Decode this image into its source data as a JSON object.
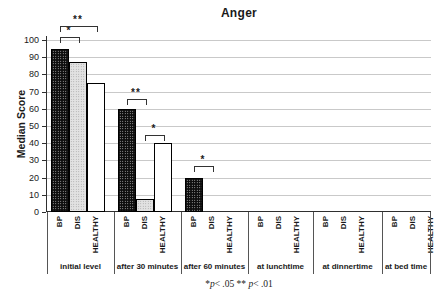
{
  "chart_data": {
    "type": "bar",
    "title": "Anger",
    "xlabel": "",
    "ylabel": "Median Score",
    "ylim": [
      0,
      100
    ],
    "yticks": [
      0,
      10,
      20,
      30,
      40,
      50,
      60,
      70,
      80,
      90,
      100
    ],
    "grid": "horizontal",
    "legend_position": "none",
    "categories": [
      "initial level",
      "after 30 minutes",
      "after 60 minutes",
      "at lunchtime",
      "at dinnertime",
      "at bed time"
    ],
    "series": [
      {
        "name": "BP",
        "fill": "black-dotted",
        "values": [
          95,
          60,
          20,
          0,
          0,
          0
        ]
      },
      {
        "name": "DIS",
        "fill": "gray-dotted",
        "values": [
          87.5,
          7.5,
          0,
          0,
          0,
          0
        ]
      },
      {
        "name": "HEALTHY",
        "fill": "white",
        "values": [
          75,
          40,
          0,
          0,
          0,
          0
        ]
      }
    ],
    "significance_brackets": [
      {
        "category": "initial level",
        "from": "BP",
        "to": "DIS",
        "label": "*",
        "y_value": 102
      },
      {
        "category": "initial level",
        "from": "BP",
        "to": "HEALTHY",
        "label": "**",
        "y_value": 108
      },
      {
        "category": "after 30 minutes",
        "from": "BP",
        "to": "DIS",
        "label": "**",
        "y_value": 65.5
      },
      {
        "category": "after 30 minutes",
        "from": "DIS",
        "to": "HEALTHY",
        "label": "*",
        "y_value": 45
      },
      {
        "category": "after 60 minutes",
        "from": "BP",
        "to": "DIS",
        "label": "*",
        "y_value": 26.5
      }
    ],
    "footnote": "*p< .05 ** p< .01",
    "footnote_parts": [
      {
        "text": "*",
        "italic": false
      },
      {
        "text": "p",
        "italic": true
      },
      {
        "text": "< .05 ** ",
        "italic": false
      },
      {
        "text": "p",
        "italic": true
      },
      {
        "text": "< .01",
        "italic": false
      }
    ]
  },
  "colors": {
    "bar_bp": "#0d0d0d",
    "bar_dis": "#e2e2e2",
    "bar_healthy": "#ffffff",
    "bar_border": "#000000",
    "gridline": "#c9c9c9",
    "axis": "#2f2f2f",
    "text": "#1a1a1a",
    "background": "#ffffff"
  }
}
